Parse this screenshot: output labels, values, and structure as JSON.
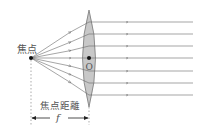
{
  "diagram": {
    "labels": {
      "focal_point": "焦点",
      "optical_center": "O",
      "focal_length_label": "焦点距離",
      "focal_length_symbol": "f"
    },
    "colors": {
      "lens_fill": "#c8c8c8",
      "lens_stroke": "#7a7a7a",
      "ray": "#6a6a6a",
      "text": "#555555",
      "point": "#111111"
    },
    "ray_count": 7
  }
}
